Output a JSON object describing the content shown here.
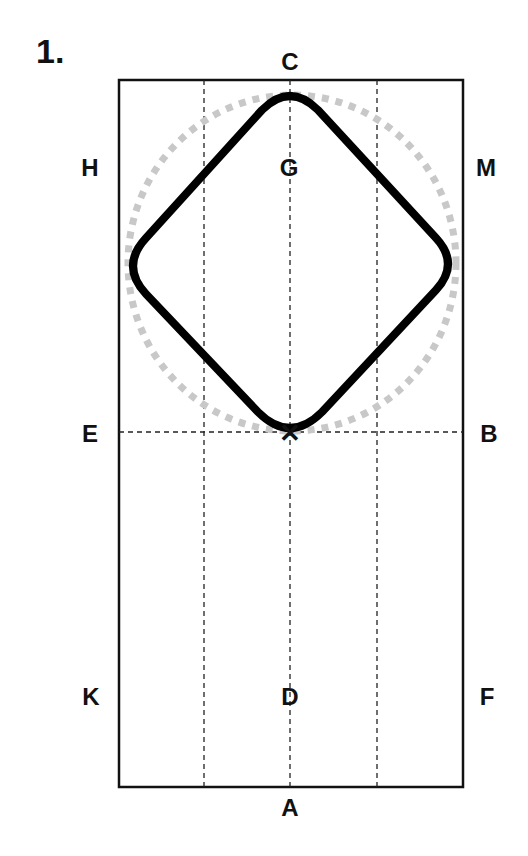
{
  "figure": {
    "number": "1.",
    "colors": {
      "arena_border": "#111111",
      "dashed_lines": "#222222",
      "figure_path": "#000000",
      "reference_circle": "#c8c8c8"
    }
  },
  "arena_letters": {
    "C": "C",
    "G": "G",
    "H": "H",
    "M": "M",
    "E": "E",
    "B": "B",
    "X": "X",
    "K": "K",
    "D": "D",
    "F": "F",
    "A": "A"
  },
  "marker": {
    "label": "X",
    "symbol": "✕"
  }
}
